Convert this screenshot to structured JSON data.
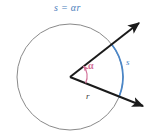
{
  "figure": {
    "title_formula": "s = αr",
    "arc_label": "s",
    "radius_label": "r",
    "angle_label": "α",
    "colors": {
      "background": "#ffffff",
      "circle_stroke": "#8a8a8a",
      "ray_stroke": "#1a1a1a",
      "arc_stroke": "#4a86c8",
      "angle_stroke": "#d4749b",
      "formula_text": "#4a7ebb",
      "arc_text": "#4a86c8",
      "radius_text": "#3a3a3a",
      "angle_text": "#d4749b"
    },
    "geometry": {
      "center_x": 70,
      "center_y": 77,
      "radius": 53,
      "ray_upper_angle_deg": -38,
      "ray_lower_angle_deg": 22,
      "angle_arc_radius": 17,
      "sector_angle_deg": 60
    },
    "elements": {
      "circle_name": "circle",
      "upper_ray_name": "upper-ray",
      "lower_ray_name": "lower-ray",
      "arc_name": "blue-arc",
      "angle_arc_name": "angle-arc"
    }
  }
}
